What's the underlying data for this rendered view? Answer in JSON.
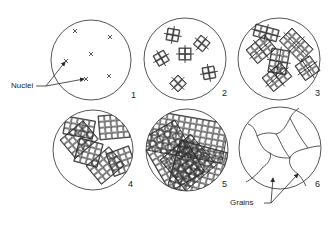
{
  "figure": {
    "panels": [
      {
        "number": "1",
        "stage": "nuclei"
      },
      {
        "number": "2",
        "stage": "crystal growth begins"
      },
      {
        "number": "3",
        "stage": "dendritic growth"
      },
      {
        "number": "4",
        "stage": "crystals extend"
      },
      {
        "number": "5",
        "stage": "crystals impinge"
      },
      {
        "number": "6",
        "stage": "grains formed"
      }
    ],
    "labels": {
      "nuclei": "Nuclei",
      "grains": "Grains"
    },
    "colors": {
      "line": "#2a2a2a",
      "background": "#ffffff"
    }
  }
}
